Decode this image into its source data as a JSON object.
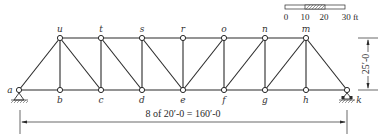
{
  "diagram": {
    "type": "Pratt truss",
    "panels": 8,
    "bottom_nodes": [
      "a",
      "b",
      "c",
      "d",
      "e",
      "f",
      "g",
      "h",
      "k"
    ],
    "top_nodes": [
      "u",
      "t",
      "s",
      "r",
      "o",
      "n",
      "m"
    ],
    "members": [
      [
        "a",
        "b"
      ],
      [
        "b",
        "c"
      ],
      [
        "c",
        "d"
      ],
      [
        "d",
        "e"
      ],
      [
        "e",
        "f"
      ],
      [
        "f",
        "g"
      ],
      [
        "g",
        "h"
      ],
      [
        "h",
        "k"
      ],
      [
        "u",
        "t"
      ],
      [
        "t",
        "s"
      ],
      [
        "s",
        "r"
      ],
      [
        "r",
        "o"
      ],
      [
        "o",
        "n"
      ],
      [
        "n",
        "m"
      ],
      [
        "a",
        "u"
      ],
      [
        "m",
        "k"
      ],
      [
        "u",
        "b"
      ],
      [
        "t",
        "c"
      ],
      [
        "s",
        "d"
      ],
      [
        "r",
        "e"
      ],
      [
        "o",
        "f"
      ],
      [
        "n",
        "g"
      ],
      [
        "m",
        "h"
      ],
      [
        "u",
        "c"
      ],
      [
        "t",
        "d"
      ],
      [
        "s",
        "e"
      ],
      [
        "e",
        "o"
      ],
      [
        "f",
        "n"
      ],
      [
        "g",
        "m"
      ]
    ],
    "supports": {
      "left": {
        "node": "a",
        "kind": "pin"
      },
      "right": {
        "node": "k",
        "kind": "roller"
      }
    },
    "span_dimension_label": "8 of 20′-0 = 160′-0",
    "height_dimension_label": "25′-0",
    "scale_bar": {
      "ticks": [
        "0",
        "10",
        "20",
        "30 ft"
      ],
      "hatched_between": [
        "10",
        "20"
      ]
    }
  }
}
